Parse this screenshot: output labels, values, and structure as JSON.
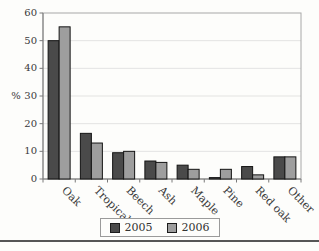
{
  "figure": {
    "background": "#fdfdfb",
    "divider_color": "#565656"
  },
  "chart_data": {
    "type": "bar",
    "title": "",
    "categories": [
      "Oak",
      "Tropical",
      "Beech",
      "Ash",
      "Maple",
      "Pine",
      "Red oak",
      "Other"
    ],
    "series": [
      {
        "name": "2005",
        "color": "#4a4a4a",
        "values": [
          50,
          16.5,
          9.5,
          6.5,
          5,
          0.5,
          4.5,
          8
        ]
      },
      {
        "name": "2006",
        "color": "#9e9e9e",
        "values": [
          55,
          13,
          10,
          6,
          3.5,
          3.5,
          1.5,
          8
        ]
      }
    ],
    "xlabel": "",
    "ylabel": "%",
    "ylim": [
      0,
      60
    ],
    "ytick_step": 10,
    "yticks": [
      "0",
      "10",
      "20",
      "30",
      "40",
      "50",
      "60"
    ],
    "grid": "horizontal",
    "legend_position": "bottom",
    "colors": {
      "gridline": "#dcdcdc",
      "plot_border": "#a8a8a8",
      "axis": "#7a7a7a",
      "bar_border": "#141414",
      "text": "#3a3a3a"
    }
  }
}
